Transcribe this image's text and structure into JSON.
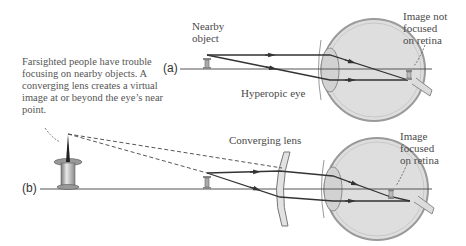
{
  "caption": "Farsighted people have trouble focusing on nearby objects. A converging lens creates a virtual image at or beyond the eye’s near point.",
  "panel_a": {
    "label": "(a)",
    "object_label": "Nearby\nobject",
    "eye_label": "Hyperopic eye",
    "image_label": "Image not\nfocused\non retina"
  },
  "panel_b": {
    "label": "(b)",
    "lens_label": "Converging lens",
    "image_label": "Image\nfocused\non retina"
  },
  "colors": {
    "ray": "#333333",
    "axis": "#555555",
    "eye_fill": "#dcdcdc",
    "eye_outline": "#8a8a8a",
    "lens_fill": "#e2e2e2",
    "text": "#4a4a4a"
  }
}
